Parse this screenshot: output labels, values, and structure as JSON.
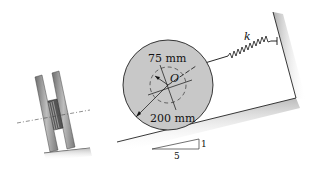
{
  "labels": {
    "inner_radius": "75 mm",
    "outer_radius": "200 mm",
    "center": "O",
    "spring_constant": "k",
    "slope_rise": "1",
    "slope_run": "5"
  },
  "colors": {
    "disk_fill": "#c8c8c8",
    "line": "#111111",
    "plate_fill": "#9a9a9a",
    "shadow": "#bbbbbb"
  }
}
